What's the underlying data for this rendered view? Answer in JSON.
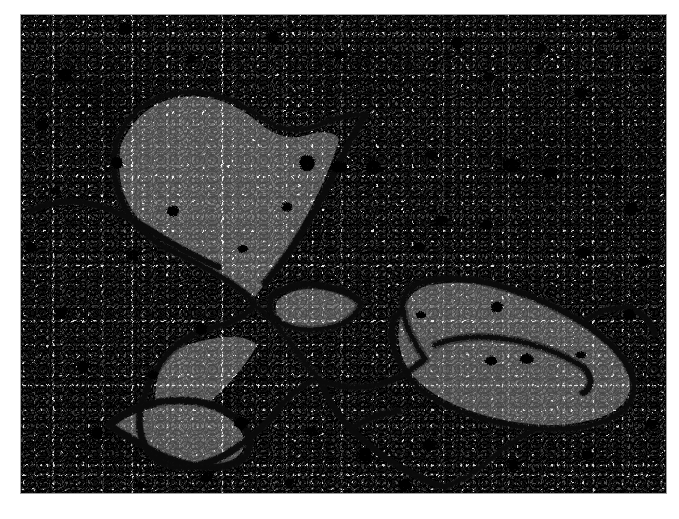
{
  "image": {
    "kind": "transmission-electron-micrograph",
    "subject": "cell cytoplasm with membrane-bound organelles",
    "caption": "",
    "plate": {
      "x": 21,
      "y": 15,
      "width": 645,
      "height": 478,
      "background_color": "#d4d4d4",
      "membrane_color": "#0d0d0d",
      "granule_color": "#111111",
      "border_color": "#9a9a9a",
      "page_background": "#ffffff"
    },
    "features": [
      {
        "name": "upper-left-organelle-lobe",
        "type": "membrane-bound-lobe",
        "approx_center": [
          150,
          120
        ]
      },
      {
        "name": "upper-right-membrane-arc",
        "type": "membrane-arc",
        "approx_center": [
          300,
          100
        ]
      },
      {
        "name": "membrane-junction",
        "type": "junction",
        "approx_center": [
          215,
          285
        ]
      },
      {
        "name": "lens-vesicle",
        "type": "vesicle",
        "approx_center": [
          305,
          295
        ]
      },
      {
        "name": "right-elongated-organelle",
        "type": "mitochondrion",
        "approx_center": [
          500,
          360
        ]
      },
      {
        "name": "lower-left-vesicle",
        "type": "vesicle",
        "approx_center": [
          150,
          415
        ]
      },
      {
        "name": "lower-branch-membrane",
        "type": "membrane-branch",
        "approx_center": [
          330,
          400
        ]
      },
      {
        "name": "ribosome-granules",
        "type": "dense-granules",
        "count": 46
      }
    ]
  },
  "membranes": [
    "M95,128 C106,100 126,82 156,78 C186,74 214,84 236,100 C254,113 272,119 292,112 C312,105 330,97 344,100",
    "M95,128 C90,152 94,176 106,196 C118,216 138,232 162,241",
    "M344,100 C336,114 326,130 318,148 C308,170 296,192 284,212 C272,232 258,252 244,268",
    "M162,241 C178,250 196,258 210,268 C220,275 228,282 234,290",
    "M10,196 C30,186 52,184 74,190 C96,196 116,206 134,218 C156,232 178,244 198,252",
    "M234,290 C246,300 258,312 268,326 C278,340 288,354 300,366",
    "M234,290 C226,300 214,306 200,310 C184,314 168,320 156,330 C142,342 132,358 126,374",
    "M126,374 C118,392 116,410 122,426 C128,442 142,452 160,452 C182,452 204,442 222,428 C238,416 252,402 262,388",
    "M262,388 C272,378 282,370 292,366",
    "M250,282 C262,272 278,268 296,270 C314,272 330,278 340,288",
    "M340,288 C336,300 326,308 312,312 C296,316 278,316 264,310 C252,305 246,296 250,282",
    "M300,366 C318,372 338,374 356,370 C374,366 390,356 404,344",
    "M300,366 C306,384 316,400 330,414 C344,428 360,440 376,450 C392,460 408,468 424,472",
    "M404,344 C392,326 384,310 382,296 C380,282 386,272 398,268",
    "M398,268 C418,262 442,262 468,268 C500,276 534,290 562,308 C588,325 606,344 612,362",
    "M612,362 C616,378 610,392 596,400 C580,410 558,414 534,414 C504,414 472,408 444,398 C418,389 398,376 388,362",
    "M388,362 C378,348 372,336 372,326",
    "M372,326 C368,312 372,300 382,296",
    "M414,330 C434,322 458,320 484,324 C512,328 540,338 562,352",
    "M562,352 C572,362 572,372 562,378",
    "M424,472 C440,466 456,456 470,444 C484,432 498,422 512,416",
    "M330,414 C344,404 360,398 378,396",
    "M88,410 C104,396 124,388 146,386 C170,384 192,388 208,398 C224,408 232,422 228,434 C224,446 210,452 192,452 C172,452 150,446 132,436 C114,426 100,418 88,410",
    "M562,308 C574,298 590,292 606,292",
    "M606,292 C620,296 630,306 634,320"
  ],
  "granules": [
    [
      104,
      14,
      7
    ],
    [
      252,
      22,
      6
    ],
    [
      436,
      28,
      6
    ],
    [
      520,
      34,
      5
    ],
    [
      602,
      20,
      6
    ],
    [
      44,
      60,
      7
    ],
    [
      170,
      44,
      5
    ],
    [
      318,
      40,
      5
    ],
    [
      468,
      62,
      6
    ],
    [
      560,
      78,
      6
    ],
    [
      626,
      56,
      6
    ],
    [
      22,
      110,
      6
    ],
    [
      96,
      148,
      6
    ],
    [
      286,
      148,
      8
    ],
    [
      318,
      152,
      8
    ],
    [
      352,
      152,
      7
    ],
    [
      410,
      140,
      6
    ],
    [
      490,
      150,
      9
    ],
    [
      528,
      158,
      7
    ],
    [
      596,
      156,
      6
    ],
    [
      34,
      176,
      5
    ],
    [
      152,
      196,
      6
    ],
    [
      266,
      192,
      5
    ],
    [
      420,
      206,
      7
    ],
    [
      466,
      210,
      6
    ],
    [
      610,
      194,
      7
    ],
    [
      10,
      232,
      6
    ],
    [
      112,
      240,
      6
    ],
    [
      222,
      234,
      5
    ],
    [
      398,
      232,
      6
    ],
    [
      562,
      238,
      7
    ],
    [
      622,
      246,
      6
    ],
    [
      40,
      298,
      6
    ],
    [
      180,
      314,
      6
    ],
    [
      400,
      300,
      5
    ],
    [
      476,
      292,
      6
    ],
    [
      608,
      300,
      6
    ],
    [
      62,
      352,
      6
    ],
    [
      132,
      360,
      5
    ],
    [
      470,
      346,
      6
    ],
    [
      506,
      344,
      7
    ],
    [
      560,
      340,
      5
    ],
    [
      76,
      418,
      6
    ],
    [
      220,
      408,
      7
    ],
    [
      290,
      416,
      6
    ],
    [
      344,
      440,
      7
    ],
    [
      408,
      430,
      6
    ],
    [
      492,
      450,
      6
    ],
    [
      566,
      440,
      6
    ],
    [
      630,
      410,
      6
    ],
    [
      186,
      462,
      6
    ],
    [
      120,
      470,
      5
    ],
    [
      384,
      470,
      6
    ],
    [
      268,
      468,
      5
    ]
  ]
}
